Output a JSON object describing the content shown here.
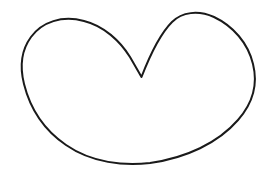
{
  "image": {
    "title": "Heart Outline Drawing",
    "kind": "line-drawing",
    "width": 270,
    "height": 176,
    "background_color": "#ffffff",
    "has_text": false,
    "has_border": false,
    "text_content": ""
  },
  "figure": {
    "name": "heart-outline",
    "stroke_color": "#1a1a1a",
    "stroke_width": 2,
    "fill": "none",
    "closed": true,
    "symmetric": false,
    "path": "M 141.5 77 L 130 57 C 120 41 104 26 84 21 C 62 15 42 22 31 37 C 20 52 20 68 24 84 C 30 108 44 130 66 145 C 92 163 124 166 150 163 C 186 158 218 143 238 120 C 253 103 258 84 253 64 C 248 43 233 26 214 17 C 198 10 182 12 172 22 C 160 34 150 55 141.5 77 Z",
    "key_points": {
      "cleft_tip": {
        "x": 141,
        "y": 77
      },
      "left_lobe_apex": {
        "x": 65,
        "y": 21
      },
      "right_lobe_apex": {
        "x": 205,
        "y": 15
      },
      "leftmost": {
        "x": 22,
        "y": 75
      },
      "rightmost": {
        "x": 255,
        "y": 90
      },
      "bottom_most": {
        "x": 145,
        "y": 163
      }
    }
  }
}
